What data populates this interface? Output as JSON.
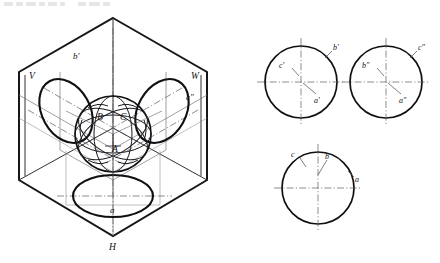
{
  "figure": {
    "kind": "descriptive-geometry-projection",
    "title_visible": false,
    "top_text_remnant": "",
    "colors": {
      "ink": "#101013",
      "plane_edge": "#17171a",
      "construction": "#6d6d72",
      "centerline": "#5c5c63",
      "background": "#ffffff"
    }
  },
  "left_view": {
    "name": "three-plane projection box with sphere",
    "plane_labels": {
      "v": "V",
      "w": "W",
      "h": "H"
    },
    "projection_labels": {
      "b_prime": "b'",
      "c_double_prime": "c″",
      "a": "a"
    },
    "point_labels": {
      "a": "A",
      "b": "B",
      "c": "C"
    }
  },
  "right_views": {
    "front_view": {
      "name": "front-view-circle",
      "labels": [
        {
          "text": "b'",
          "role": "outside-upper-right"
        },
        {
          "text": "c'",
          "role": "inside-upper-left"
        },
        {
          "text": "a'",
          "role": "inside-lower-right"
        }
      ]
    },
    "side_view": {
      "name": "side-view-circle",
      "labels": [
        {
          "text": "c″",
          "role": "outside-upper-right"
        },
        {
          "text": "b″",
          "role": "inside-upper-left"
        },
        {
          "text": "a″",
          "role": "inside-lower-right"
        }
      ]
    },
    "top_view": {
      "name": "top-view-circle",
      "labels": [
        {
          "text": "c",
          "role": "inside-upper-left"
        },
        {
          "text": "b",
          "role": "inside-upper-center"
        },
        {
          "text": "a",
          "role": "outside-right"
        }
      ]
    }
  }
}
